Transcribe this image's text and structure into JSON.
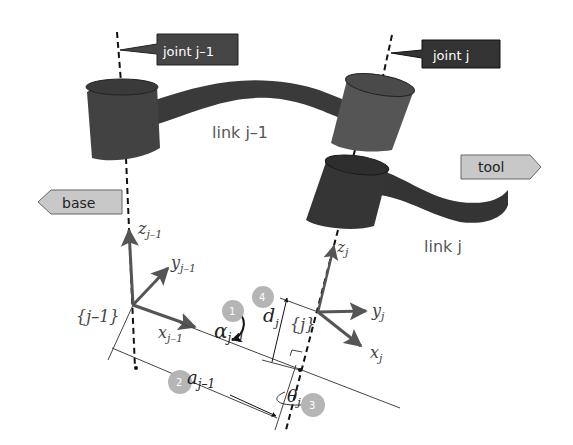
{
  "diagram": {
    "callouts": {
      "joint_prev": "joint j–1",
      "joint_curr": "joint j",
      "base": "base",
      "tool": "tool"
    },
    "links": {
      "link_prev": "link j–1",
      "link_curr": "link j"
    },
    "frames": {
      "prev": {
        "label": "{j–1}",
        "z": {
          "base": "z",
          "sub": "j–1"
        },
        "y": {
          "base": "y",
          "sub": "j–1"
        },
        "x": {
          "base": "x",
          "sub": "j–1"
        }
      },
      "curr": {
        "label": "{j}",
        "z": {
          "base": "z",
          "sub": "j"
        },
        "y": {
          "base": "y",
          "sub": "j"
        },
        "x": {
          "base": "x",
          "sub": "j"
        }
      }
    },
    "parameters": [
      {
        "step": "1",
        "symbol": "α",
        "sub": "j–1",
        "name": "link twist"
      },
      {
        "step": "2",
        "symbol": "a",
        "sub": "j–1",
        "name": "link length"
      },
      {
        "step": "3",
        "symbol": "θ",
        "sub": "j",
        "name": "joint angle"
      },
      {
        "step": "4",
        "symbol": "d",
        "sub": "j",
        "name": "link offset"
      }
    ],
    "colors": {
      "joint_dark": "#3c3c3c",
      "joint_mid": "#555555",
      "link": "#3a3a3a",
      "callout_dark": "#454545",
      "callout_light": "#c8c8c8",
      "axis_arrow": "#555555",
      "step_badge": "#b5b5b5",
      "text_gray": "#555555"
    }
  }
}
